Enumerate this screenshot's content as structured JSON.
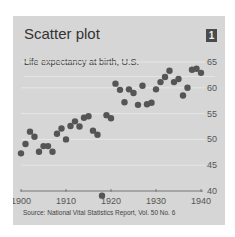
{
  "card": {
    "title": "Scatter plot",
    "badge": "1",
    "subtitle": "Life expectancy at birth, U.S.",
    "source": "Source:  National Vital Statistics Report, Vol. 50 No. 6"
  },
  "colors": {
    "background": "#d6d6d6",
    "point": "#555555",
    "gridline": "#e6e6e6",
    "axis": "#777777",
    "badge": "#4a4a4a"
  },
  "chart_data": {
    "type": "scatter",
    "title": "Scatter plot",
    "subtitle": "Life expectancy at birth, U.S.",
    "xlabel": "",
    "ylabel": "",
    "xlim": [
      1900,
      1940
    ],
    "ylim": [
      40,
      65
    ],
    "xticks": [
      1900,
      1910,
      1920,
      1930,
      1940
    ],
    "yticks": [
      40,
      45,
      50,
      55,
      60,
      65
    ],
    "y_axis_position": "right",
    "grid": "horizontal",
    "legend": null,
    "annotation": "Source:  National Vital Statistics Report, Vol. 50 No. 6",
    "x": [
      1900,
      1901,
      1902,
      1903,
      1904,
      1905,
      1906,
      1907,
      1908,
      1909,
      1910,
      1911,
      1912,
      1913,
      1914,
      1915,
      1916,
      1917,
      1918,
      1919,
      1920,
      1921,
      1922,
      1923,
      1924,
      1925,
      1926,
      1927,
      1928,
      1929,
      1930,
      1931,
      1932,
      1933,
      1934,
      1935,
      1936,
      1937,
      1938,
      1939,
      1940
    ],
    "y": [
      47.3,
      49.1,
      51.5,
      50.5,
      47.6,
      48.7,
      48.7,
      47.6,
      51.1,
      52.1,
      50.0,
      52.6,
      53.5,
      52.5,
      54.2,
      54.5,
      51.7,
      50.9,
      39.1,
      54.7,
      54.1,
      60.8,
      59.6,
      57.2,
      59.7,
      59.0,
      56.7,
      60.4,
      56.8,
      57.1,
      59.7,
      61.1,
      62.1,
      63.3,
      61.1,
      61.7,
      58.5,
      60.0,
      63.5,
      63.7,
      62.9
    ]
  }
}
